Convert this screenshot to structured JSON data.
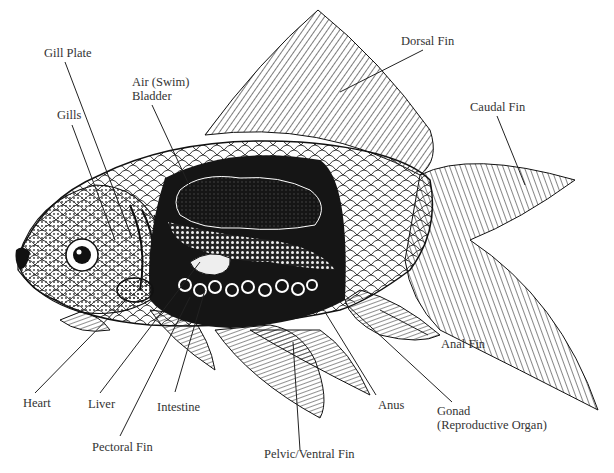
{
  "colors": {
    "ink": "#1a1a1a",
    "background": "#ffffff",
    "label_text": "#333333"
  },
  "labels": {
    "gill_plate": "Gill Plate",
    "gills": "Gills",
    "air_bladder_line1": "Air (Swim)",
    "air_bladder_line2": "Bladder",
    "dorsal_fin": "Dorsal Fin",
    "caudal_fin": "Caudal Fin",
    "anal_fin": "Anal Fin",
    "heart": "Heart",
    "liver": "Liver",
    "intestine": "Intestine",
    "pectoral_fin": "Pectoral Fin",
    "pelvic_ventral_fin": "Pelvic/Ventral Fin",
    "anus": "Anus",
    "gonad_line1": "Gonad",
    "gonad_line2": "(Reproductive Organ)"
  }
}
